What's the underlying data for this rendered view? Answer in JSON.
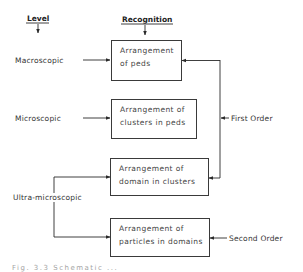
{
  "diagram": {
    "headers": {
      "level": "Level",
      "recognition": "Recognition"
    },
    "levels": [
      {
        "id": "macroscopic",
        "label": "Macroscopic"
      },
      {
        "id": "microscopic",
        "label": "Microscopic"
      },
      {
        "id": "ultra-microscopic",
        "label": "Ultra-microscopic"
      }
    ],
    "boxes": [
      {
        "id": "peds",
        "lines": [
          "Arrangement",
          "of peds"
        ]
      },
      {
        "id": "clusters-in-peds",
        "lines": [
          "Arrangement of",
          "clusters in peds"
        ]
      },
      {
        "id": "domain-in-clusters",
        "lines": [
          "Arrangement of",
          "domain in clusters"
        ]
      },
      {
        "id": "particles-in-domains",
        "lines": [
          "Arrangement of",
          "particles in domains"
        ]
      }
    ],
    "orders": {
      "first": "First Order",
      "second": "Second Order"
    },
    "edges": [
      {
        "from": "Level",
        "to": "levels",
        "type": "header-arrow"
      },
      {
        "from": "Recognition",
        "to": "peds",
        "type": "header-arrow"
      },
      {
        "from": "macroscopic",
        "to": "peds"
      },
      {
        "from": "microscopic",
        "to": "clusters-in-peds"
      },
      {
        "from": "ultra-microscopic",
        "to": "domain-in-clusters"
      },
      {
        "from": "ultra-microscopic",
        "to": "particles-in-domains"
      },
      {
        "from": "First Order",
        "to": "peds"
      },
      {
        "from": "First Order",
        "to": "domain-in-clusters"
      },
      {
        "from": "Second Order",
        "to": "particles-in-domains"
      }
    ],
    "caption": "Fig. 3.3 Schematic ..."
  }
}
